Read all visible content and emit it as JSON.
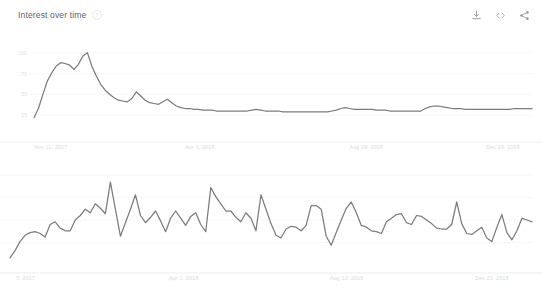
{
  "header": {
    "title": "Interest over time",
    "info_icon": "info-circle-icon",
    "actions": [
      {
        "name": "download-icon",
        "label": "Download"
      },
      {
        "name": "embed-icon",
        "label": "Embed"
      },
      {
        "name": "share-icon",
        "label": "Share"
      }
    ]
  },
  "accent_colors": {
    "line": "#7c7c7c",
    "gridline": "#f6f7f8",
    "axis": "#ededee",
    "text": "#5f6368",
    "axis_text": "#d8dadd"
  },
  "chart_data": [
    {
      "id": "interest-over-time-weekly",
      "type": "line",
      "title": "Interest over time",
      "xlabel": "",
      "ylabel": "",
      "ylim": [
        0,
        108
      ],
      "grid": true,
      "legend": "none",
      "ytick_labels": [
        "100",
        "75",
        "50",
        "25"
      ],
      "ytick_values": [
        100,
        75,
        50,
        25
      ],
      "xtick_labels": [
        "Nov 12, 2017",
        "Apr 1, 2018",
        "Aug 19, 2018",
        "Dec 23, 2018"
      ],
      "xtick_positions": [
        0,
        0.333,
        0.667,
        0.975
      ],
      "values": [
        22,
        33,
        50,
        66,
        76,
        84,
        88,
        87,
        85,
        80,
        86,
        96,
        100,
        84,
        72,
        62,
        55,
        50,
        46,
        43,
        42,
        41,
        45,
        53,
        48,
        43,
        40,
        39,
        38,
        41,
        44,
        40,
        36,
        34,
        33,
        33,
        32,
        32,
        31,
        31,
        31,
        30,
        30,
        30,
        30,
        30,
        30,
        30,
        30,
        31,
        32,
        31,
        30,
        30,
        30,
        30,
        29,
        29,
        29,
        29,
        29,
        29,
        29,
        29,
        29,
        29,
        29,
        30,
        31,
        33,
        34,
        33,
        32,
        32,
        32,
        32,
        32,
        31,
        31,
        31,
        30,
        30,
        30,
        30,
        30,
        30,
        30,
        30,
        33,
        35,
        36,
        36,
        35,
        34,
        33,
        33,
        33,
        32,
        32,
        32,
        32,
        32,
        32,
        32,
        32,
        32,
        32,
        32,
        33,
        33,
        33,
        33,
        33
      ]
    },
    {
      "id": "interest-over-time-daily",
      "type": "line",
      "title": "",
      "xlabel": "",
      "ylabel": "",
      "ylim": [
        0,
        100
      ],
      "grid": true,
      "legend": "none",
      "ytick_labels": [],
      "ytick_values": [],
      "xtick_labels": [
        "5, 2017",
        "Apr 1, 2018",
        "Aug 12, 2018",
        "Dec 23, 2018"
      ],
      "xtick_positions": [
        0.012,
        0.333,
        0.645,
        0.955
      ],
      "values": [
        8,
        16,
        26,
        33,
        36,
        37,
        35,
        31,
        45,
        48,
        41,
        38,
        38,
        50,
        55,
        62,
        58,
        68,
        63,
        57,
        92,
        62,
        32,
        47,
        62,
        78,
        55,
        47,
        53,
        60,
        49,
        37,
        52,
        60,
        52,
        44,
        54,
        58,
        45,
        37,
        86,
        76,
        68,
        60,
        60,
        53,
        48,
        58,
        52,
        38,
        78,
        62,
        46,
        33,
        30,
        40,
        43,
        42,
        38,
        44,
        66,
        66,
        62,
        32,
        22,
        36,
        50,
        63,
        70,
        58,
        44,
        42,
        38,
        37,
        35,
        48,
        52,
        56,
        57,
        47,
        45,
        55,
        54,
        50,
        46,
        41,
        40,
        40,
        45,
        70,
        46,
        35,
        34,
        38,
        42,
        30,
        26,
        42,
        56,
        36,
        28,
        38,
        52,
        50,
        48
      ]
    }
  ]
}
